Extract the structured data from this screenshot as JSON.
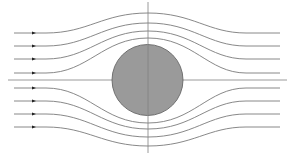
{
  "diagram": {
    "type": "flow-around-cylinder",
    "colors": {
      "background": "#ffffff",
      "cylinder_fill": "#9a9a9a",
      "cylinder_stroke": "#666666",
      "streamline": "#7a7a7a",
      "axis": "#808080",
      "arrow": "#222222"
    },
    "streamline_count_above": 4,
    "streamline_count_below": 4,
    "flow_direction": "left-to-right",
    "has_arrows": true
  }
}
